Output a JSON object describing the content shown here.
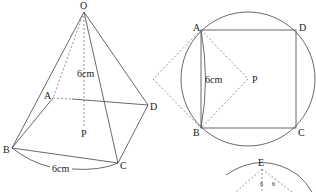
{
  "figures": {
    "pyramid": {
      "labels": {
        "O": "O",
        "A": "A",
        "B": "B",
        "C": "C",
        "D": "D",
        "P": "P"
      },
      "height_label": "6cm",
      "base_edge_label": "6cm"
    },
    "square_in_circle": {
      "labels": {
        "A": "A",
        "B": "B",
        "C": "C",
        "D": "D",
        "P": "P"
      },
      "side_label": "6cm"
    },
    "partial_figure": {
      "labels": {
        "E": "E",
        "tick1": "6",
        "tick2": "6"
      }
    }
  }
}
